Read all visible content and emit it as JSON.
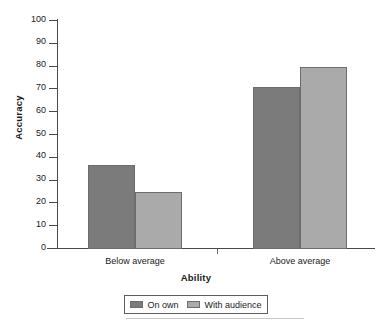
{
  "chart_data": {
    "type": "bar",
    "title": "",
    "xlabel": "Ability",
    "ylabel": "Accuracy",
    "categories": [
      "Below average",
      "Above average"
    ],
    "series": [
      {
        "name": "On own",
        "values": [
          37,
          71
        ],
        "color": "#7b7b7b"
      },
      {
        "name": "With audience",
        "values": [
          25,
          80
        ],
        "color": "#aaaaaa"
      }
    ],
    "ylim": [
      0,
      100
    ],
    "yticks": [
      0,
      10,
      20,
      30,
      40,
      50,
      60,
      70,
      80,
      90,
      100
    ],
    "ytick_labels": [
      "0",
      "10",
      "20",
      "30",
      "40",
      "50",
      "60",
      "70",
      "80",
      "90",
      "100"
    ],
    "grid": false,
    "legend_position": "bottom"
  },
  "axes": {
    "y_title": "Accuracy",
    "x_title": "Ability",
    "y_labels": [
      "100",
      "90",
      "80",
      "70",
      "60",
      "50",
      "40",
      "30",
      "20",
      "10",
      "0"
    ],
    "x_labels": [
      "Below average",
      "Above average"
    ]
  },
  "legend": {
    "entries": [
      {
        "label": "On own",
        "color": "#7b7b7b"
      },
      {
        "label": "With audience",
        "color": "#aaaaaa"
      }
    ]
  },
  "colors": {
    "series_dark": "#7b7b7b",
    "series_light": "#aaaaaa",
    "axis": "#4a4a4a",
    "text": "#1a1a1a",
    "background": "#ffffff"
  }
}
